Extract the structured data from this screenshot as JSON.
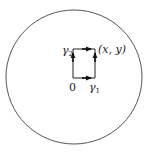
{
  "diagram": {
    "disk": {
      "cx": 74,
      "cy": 77,
      "rx": 68,
      "ry": 67,
      "stroke": "#555555"
    },
    "rectangle": {
      "x0": 73,
      "y0": 49,
      "x1": 95,
      "y1": 78,
      "stroke": "#222222"
    },
    "labels": {
      "gamma2": {
        "base": "γ",
        "sub": "2"
      },
      "gamma1": {
        "base": "γ",
        "sub": "1"
      },
      "origin": "0",
      "point": "(x, y)"
    },
    "paths": [
      {
        "name": "gamma1",
        "description": "right along bottom then up right side"
      },
      {
        "name": "gamma2",
        "description": "up left side then right along top"
      }
    ]
  }
}
